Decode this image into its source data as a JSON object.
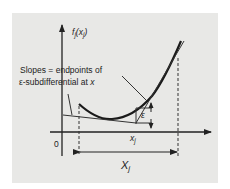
{
  "diagram": {
    "y_axis_label": {
      "main": "f",
      "sub": "j",
      "arg_open": "(x",
      "arg_sub": "j",
      "arg_close": ")"
    },
    "origin_label": "0",
    "point_label": {
      "main": "x",
      "sub": "j"
    },
    "domain_label": {
      "main": "X",
      "sub": "j"
    },
    "epsilon_label": "ε",
    "annotation": {
      "line1": "Slopes = endpoints of",
      "line2_prefix": "ε-subdifferential at ",
      "line2_var": "x"
    },
    "colors": {
      "background": "#ffffff",
      "panel": "#e8e8e6",
      "ink": "#222222"
    }
  }
}
